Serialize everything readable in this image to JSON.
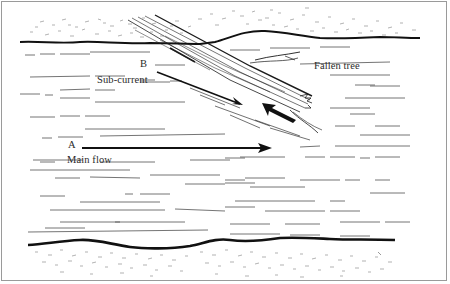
{
  "diagram": {
    "labels": {
      "point_a": "A",
      "main_flow": "Main flow",
      "point_b": "B",
      "sub_current": "Sub-current",
      "fallen_tree": "Fallen tree"
    },
    "elements": [
      {
        "name": "top-bank",
        "type": "riverbank"
      },
      {
        "name": "bottom-bank",
        "type": "riverbank"
      },
      {
        "name": "fallen-tree",
        "type": "log"
      },
      {
        "name": "main-flow-arrow",
        "direction": "right"
      },
      {
        "name": "sub-current-arrow",
        "direction": "down-right"
      },
      {
        "name": "eddy-arrow",
        "direction": "up-left"
      }
    ],
    "colors": {
      "ink": "#1a1a1a",
      "frame": "#9a9a9a",
      "background": "#ffffff"
    }
  }
}
